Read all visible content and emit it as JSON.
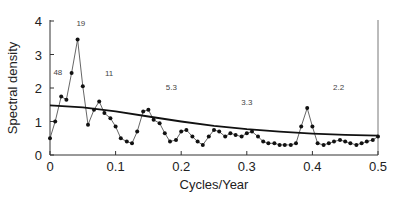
{
  "chart_data": {
    "type": "line",
    "title": "",
    "xlabel": "Cycles/Year",
    "ylabel": "Spectral density",
    "xlim": [
      0,
      0.5
    ],
    "ylim": [
      0,
      4
    ],
    "xticks": [
      0,
      0.1,
      0.2,
      0.3,
      0.4,
      0.5
    ],
    "xtick_labels": [
      "0",
      "0.1",
      "0.2",
      "0.3",
      "0.4",
      "0.5"
    ],
    "yticks": [
      0,
      1,
      2,
      3,
      4
    ],
    "ytick_labels": [
      "0",
      "1",
      "2",
      "3",
      "4"
    ],
    "grid": false,
    "legend": null,
    "series": [
      {
        "name": "Spectral density estimate",
        "style": "line-with-markers",
        "x": [
          0.0,
          0.008,
          0.017,
          0.025,
          0.033,
          0.042,
          0.05,
          0.058,
          0.067,
          0.075,
          0.083,
          0.092,
          0.1,
          0.108,
          0.117,
          0.125,
          0.133,
          0.142,
          0.15,
          0.158,
          0.167,
          0.175,
          0.183,
          0.192,
          0.2,
          0.208,
          0.217,
          0.225,
          0.233,
          0.242,
          0.25,
          0.258,
          0.267,
          0.275,
          0.283,
          0.292,
          0.3,
          0.308,
          0.317,
          0.325,
          0.333,
          0.342,
          0.35,
          0.358,
          0.367,
          0.375,
          0.383,
          0.392,
          0.4,
          0.408,
          0.417,
          0.425,
          0.433,
          0.442,
          0.45,
          0.458,
          0.467,
          0.475,
          0.483,
          0.492,
          0.5
        ],
        "y": [
          0.5,
          1.0,
          1.75,
          1.65,
          2.45,
          3.45,
          2.05,
          0.9,
          1.35,
          1.6,
          1.25,
          1.1,
          0.85,
          0.5,
          0.4,
          0.35,
          0.7,
          1.3,
          1.35,
          1.05,
          0.95,
          0.65,
          0.4,
          0.45,
          0.7,
          0.75,
          0.55,
          0.4,
          0.3,
          0.55,
          0.75,
          0.7,
          0.55,
          0.65,
          0.6,
          0.55,
          0.65,
          0.7,
          0.55,
          0.4,
          0.35,
          0.35,
          0.3,
          0.3,
          0.3,
          0.35,
          0.85,
          1.4,
          0.85,
          0.35,
          0.3,
          0.35,
          0.4,
          0.45,
          0.4,
          0.35,
          0.3,
          0.35,
          0.4,
          0.45,
          0.55
        ]
      },
      {
        "name": "Smooth background spectrum",
        "style": "line",
        "x": [
          0.0,
          0.05,
          0.1,
          0.15,
          0.2,
          0.25,
          0.3,
          0.35,
          0.4,
          0.45,
          0.5
        ],
        "y": [
          1.48,
          1.42,
          1.3,
          1.15,
          1.0,
          0.87,
          0.77,
          0.7,
          0.64,
          0.6,
          0.58
        ]
      }
    ],
    "annotations": [
      {
        "text": "48",
        "x": 0.012,
        "y": 2.4
      },
      {
        "text": "19",
        "x": 0.047,
        "y": 3.85
      },
      {
        "text": "11",
        "x": 0.09,
        "y": 2.35
      },
      {
        "text": "5.3",
        "x": 0.185,
        "y": 1.95
      },
      {
        "text": "3.3",
        "x": 0.3,
        "y": 1.5
      },
      {
        "text": "2.2",
        "x": 0.44,
        "y": 1.95
      }
    ]
  }
}
